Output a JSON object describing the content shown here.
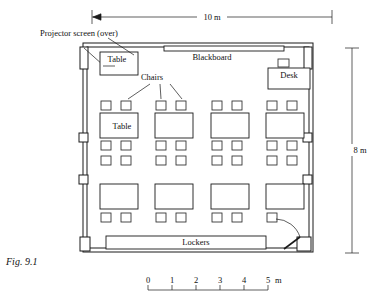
{
  "figure": {
    "caption": "Fig. 9.1",
    "caption_x": 6,
    "caption_y": 265
  },
  "room": {
    "outer": {
      "x": 83,
      "y": 43,
      "w": 230,
      "h": 209
    },
    "wall_stroke": "#1a1a1a"
  },
  "dimensions": {
    "width": {
      "label": "10 m",
      "x1": 92,
      "x2": 332,
      "y": 17,
      "text_x": 212,
      "text_y": 20
    },
    "height": {
      "label": "8 m",
      "y1": 48,
      "y2": 253,
      "x": 352,
      "text_x": 360,
      "text_y": 153
    }
  },
  "scale_bar": {
    "unit_label": "m",
    "ticks": [
      "0",
      "1",
      "2",
      "3",
      "4",
      "5"
    ],
    "x_start": 148,
    "x_end": 268,
    "y_line": 290,
    "y_text": 283,
    "unit_x": 275
  },
  "labels": {
    "projector_screen": {
      "text": "Projector screen (over)",
      "x": 40,
      "y": 36
    },
    "table_top": {
      "text": "Table",
      "x": 117,
      "y": 62
    },
    "table_grid": {
      "text": "Table",
      "x": 122,
      "y": 129
    },
    "blackboard": {
      "text": "Blackboard",
      "x": 212,
      "y": 60
    },
    "desk": {
      "text": "Desk",
      "x": 289,
      "y": 78
    },
    "chairs": {
      "text": "Chairs",
      "x": 152,
      "y": 80
    },
    "lockers": {
      "text": "Lockers",
      "x": 196,
      "y": 245
    }
  },
  "furniture": {
    "blackboard": {
      "x": 164,
      "y": 46,
      "w": 120,
      "h": 5
    },
    "corner_table": {
      "x": 100,
      "y": 52,
      "w": 38,
      "h": 23
    },
    "desk": {
      "x": 268,
      "y": 68,
      "w": 42,
      "h": 21
    },
    "desk_chair": {
      "x": 278,
      "y": 59,
      "w": 11,
      "h": 8
    },
    "lockers": {
      "x": 106,
      "y": 236,
      "w": 160,
      "h": 13
    }
  },
  "seating": {
    "table_w": 38,
    "table_h": 25,
    "chair_w": 10,
    "chair_h": 9,
    "table_cols_x": [
      100,
      155,
      211,
      266
    ],
    "chair_cols_x": [
      [
        101,
        121
      ],
      [
        156,
        176
      ],
      [
        212,
        232
      ],
      [
        267,
        287
      ]
    ],
    "table_rows_y": [
      113,
      184
    ],
    "chair_rows_y": [
      101,
      141,
      156,
      213
    ],
    "last_row_chair_count": 7
  },
  "wall_features": {
    "left_windows": [
      {
        "x": 79,
        "y": 133,
        "w": 9,
        "h": 9
      },
      {
        "x": 79,
        "y": 175,
        "w": 9,
        "h": 9
      }
    ],
    "right_windows": [
      {
        "x": 303,
        "y": 133,
        "w": 9,
        "h": 9
      },
      {
        "x": 303,
        "y": 175,
        "w": 9,
        "h": 9
      }
    ],
    "left_pier_top": {
      "x": 80,
      "y": 47,
      "w": 8,
      "h": 22
    },
    "right_pier_top": {
      "x": 304,
      "y": 47,
      "w": 8,
      "h": 22
    },
    "left_pier_bottom": {
      "x": 80,
      "y": 237,
      "w": 10,
      "h": 14
    },
    "right_pier_bottom": {
      "x": 297,
      "y": 237,
      "w": 14,
      "h": 14
    }
  },
  "door": {
    "leaf": {
      "x1": 284,
      "y1": 249,
      "x2": 300,
      "y2": 237
    },
    "arc": "M 300 237 A 26 26 0 0 0 276 219"
  },
  "projector_screen_line": {
    "x1": 84,
    "y1": 48,
    "x2": 112,
    "y2": 73
  },
  "leaders": {
    "projector": [
      {
        "x1": 108,
        "y1": 38,
        "x2": 134,
        "y2": 55
      }
    ],
    "chairs": [
      {
        "x1": 150,
        "y1": 84,
        "x2": 128,
        "y2": 99
      },
      {
        "x1": 160,
        "y1": 84,
        "x2": 161,
        "y2": 99
      },
      {
        "x1": 170,
        "y1": 84,
        "x2": 182,
        "y2": 99
      }
    ],
    "table_top": [
      {
        "x1": 115,
        "y1": 66,
        "x2": 103,
        "y2": 66
      }
    ]
  }
}
